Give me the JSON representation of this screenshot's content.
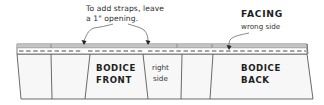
{
  "diagram": {
    "callout_straps": {
      "line1": "To add straps, leave",
      "line2": "a 1\" opening."
    },
    "callout_facing": {
      "title": "FACING",
      "subtitle": "wrong side"
    },
    "panels": {
      "bodice_front": {
        "line1": "BODICE",
        "line2": "FRONT"
      },
      "right_side": {
        "line1": "right",
        "line2": "side"
      },
      "bodice_back": {
        "line1": "BODICE",
        "line2": "BACK"
      }
    },
    "colors": {
      "outline": "#5a5a5a",
      "facing_strip": "#bdbdbd",
      "panel_fill": "#f7f7f7",
      "stitch": "#4a4a4a",
      "text": "#2b2b2b"
    }
  }
}
